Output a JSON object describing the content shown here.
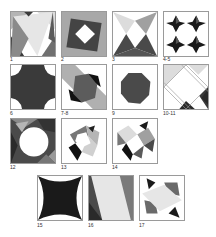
{
  "figure": {
    "tiles": [
      {
        "id": "1",
        "label": "1",
        "x": 10,
        "y": 11,
        "lx": 10,
        "ly": 57
      },
      {
        "id": "2",
        "label": "2",
        "x": 61,
        "y": 11,
        "lx": 61,
        "ly": 57
      },
      {
        "id": "3",
        "label": "3",
        "x": 112,
        "y": 11,
        "lx": 112,
        "ly": 57
      },
      {
        "id": "4-5",
        "label": "4-5",
        "x": 163,
        "y": 11,
        "lx": 163,
        "ly": 57
      },
      {
        "id": "6",
        "label": "6",
        "x": 10,
        "y": 64,
        "lx": 10,
        "ly": 111
      },
      {
        "id": "7-8",
        "label": "7-8",
        "x": 61,
        "y": 64,
        "lx": 61,
        "ly": 111
      },
      {
        "id": "9",
        "label": "9",
        "x": 112,
        "y": 64,
        "lx": 112,
        "ly": 111
      },
      {
        "id": "10-11",
        "label": "10-11",
        "x": 163,
        "y": 64,
        "lx": 163,
        "ly": 111
      },
      {
        "id": "12",
        "label": "12",
        "x": 10,
        "y": 118,
        "lx": 10,
        "ly": 165
      },
      {
        "id": "13",
        "label": "13",
        "x": 61,
        "y": 118,
        "lx": 61,
        "ly": 165
      },
      {
        "id": "14",
        "label": "14",
        "x": 112,
        "y": 118,
        "lx": 112,
        "ly": 165
      },
      {
        "id": "15",
        "label": "15",
        "x": 37,
        "y": 175,
        "lx": 37,
        "ly": 223
      },
      {
        "id": "16",
        "label": "16",
        "x": 88,
        "y": 175,
        "lx": 88,
        "ly": 223
      },
      {
        "id": "17",
        "label": "17",
        "x": 139,
        "y": 175,
        "lx": 139,
        "ly": 223
      }
    ]
  },
  "colors": {
    "black": "#1a1a1a",
    "dark": "#3c3c3c",
    "mid": "#707070",
    "light": "#b5b5b5",
    "pale": "#dcdcdc",
    "white": "#ffffff"
  }
}
